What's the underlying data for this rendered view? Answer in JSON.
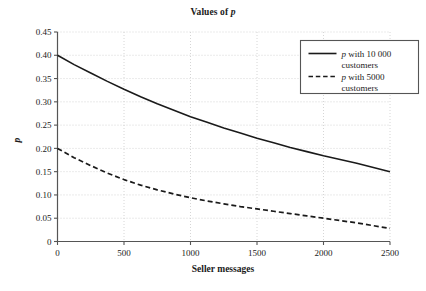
{
  "chart_data": {
    "type": "line",
    "title_plain": "Values of p",
    "xlabel": "Seller messages",
    "ylabel": "p",
    "xlim": [
      0,
      2500
    ],
    "ylim": [
      0,
      0.45
    ],
    "grid": true,
    "grid_style": "dotted",
    "legend_position": "top-right",
    "xticks": [
      "0",
      "500",
      "1000",
      "1500",
      "2000",
      "2500"
    ],
    "xtick_values": [
      0,
      500,
      1000,
      1500,
      2000,
      2500
    ],
    "yticks": [
      "0",
      "0.05",
      "0.10",
      "0.15",
      "0.20",
      "0.25",
      "0.30",
      "0.35",
      "0.40",
      "0.45"
    ],
    "ytick_values": [
      0,
      0.05,
      0.1,
      0.15,
      0.2,
      0.25,
      0.3,
      0.35,
      0.4,
      0.45
    ],
    "x": [
      0,
      125,
      250,
      375,
      500,
      625,
      750,
      875,
      1000,
      1125,
      1250,
      1375,
      1500,
      1625,
      1750,
      1875,
      2000,
      2125,
      2250,
      2375,
      2500
    ],
    "series": [
      {
        "name": "p with 10 000 customers",
        "style": "solid",
        "color": "#1a1a1a",
        "values": [
          0.4,
          0.38,
          0.362,
          0.344,
          0.327,
          0.311,
          0.296,
          0.282,
          0.268,
          0.256,
          0.244,
          0.233,
          0.222,
          0.212,
          0.202,
          0.193,
          0.184,
          0.176,
          0.168,
          0.159,
          0.15
        ]
      },
      {
        "name": "p with 5000 customers",
        "style": "dashed",
        "color": "#1a1a1a",
        "values": [
          0.2,
          0.18,
          0.163,
          0.147,
          0.133,
          0.121,
          0.111,
          0.102,
          0.094,
          0.087,
          0.081,
          0.075,
          0.07,
          0.065,
          0.06,
          0.055,
          0.05,
          0.045,
          0.04,
          0.034,
          0.028
        ]
      }
    ]
  },
  "legend": {
    "entries": [
      {
        "line1_prefix": "p",
        "line1_rest": " with 10 000",
        "line2": "customers",
        "marker": "solid-line-swatch"
      },
      {
        "line1_prefix": "p",
        "line1_rest": " with 5000",
        "line2": "customers",
        "marker": "dashed-line-swatch"
      }
    ]
  },
  "style": {
    "axis_color": "#555555",
    "grid_color": "#cccccc",
    "line_color": "#1a1a1a",
    "background": "#ffffff",
    "legend_border": "#555555"
  }
}
